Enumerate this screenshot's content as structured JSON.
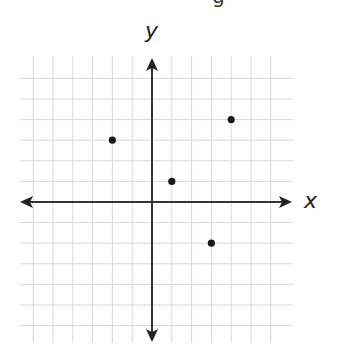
{
  "header_fragment": "g",
  "chart_data": {
    "type": "scatter",
    "title": "",
    "xlabel": "x",
    "ylabel": "y",
    "xlim": [
      -6,
      6
    ],
    "ylim": [
      -6,
      6
    ],
    "grid": true,
    "tick_labels": false,
    "points": [
      {
        "x": -2,
        "y": 3
      },
      {
        "x": 4,
        "y": 4
      },
      {
        "x": 1,
        "y": 1
      },
      {
        "x": 3,
        "y": -2
      }
    ],
    "colors": {
      "grid": "#d8d8d8",
      "axis": "#333333",
      "point": "#1a1a1a"
    }
  }
}
